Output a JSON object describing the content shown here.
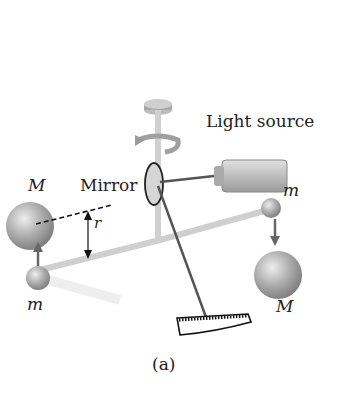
{
  "diagram": {
    "labels": {
      "light_source": "Light source",
      "mirror": "Mirror",
      "M_left": "M",
      "M_right": "M",
      "m_left": "m",
      "m_right": "m",
      "r": "r",
      "caption": "(a)"
    },
    "colors": {
      "sphere": "#9a9a9a",
      "rod": "#c8c8c8",
      "arrow": "#555555",
      "beam": "#666666"
    }
  }
}
